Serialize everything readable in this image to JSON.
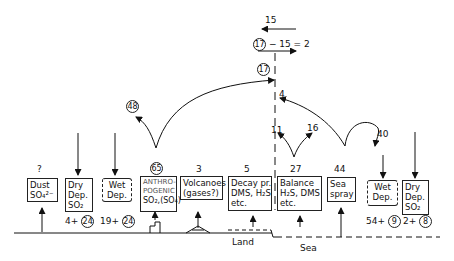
{
  "diagram": {
    "type": "sulfur-cycle-flux-diagram",
    "top": {
      "flux_left": "15",
      "flux_right_expr_circled": "17",
      "flux_right_expr_rest": "− 15 = 2",
      "transport_circled": "17"
    },
    "arcs": {
      "anthro_to_land_circled": "48",
      "sea_to_boundary": "4",
      "balance_left": "11",
      "balance_right": "16",
      "seaspray_to_wet": "40"
    },
    "sources": [
      {
        "id": "dust",
        "value": "?",
        "lines": [
          "Dust",
          "SO₄²⁻"
        ]
      },
      {
        "id": "dry-dep-land",
        "lines": [
          "Dry",
          "Dep.",
          "SO₂"
        ],
        "below_plain": "4+",
        "below_circled": "24"
      },
      {
        "id": "wet-dep-land",
        "lines": [
          "Wet",
          "Dep."
        ],
        "below_plain": "19+",
        "below_circled": "24"
      },
      {
        "id": "anthropogenic",
        "value_circled": "65",
        "lines": [
          "ANTHRO-",
          "POGENIC",
          "SO₂,(SO₄)"
        ]
      },
      {
        "id": "volcanoes",
        "value": "3",
        "lines": [
          "Volcanoes",
          "(gases?)"
        ]
      },
      {
        "id": "decay",
        "value": "5",
        "lines": [
          "Decay pr.",
          "DMS, H₂S",
          "etc."
        ]
      },
      {
        "id": "balance",
        "value": "27",
        "lines": [
          "Balance",
          "H₂S, DMS",
          "etc."
        ]
      },
      {
        "id": "sea-spray",
        "value": "44",
        "lines": [
          "Sea",
          "spray"
        ]
      },
      {
        "id": "wet-dep-sea",
        "lines": [
          "Wet",
          "Dep."
        ],
        "below_plain": "54+",
        "below_circled": "9"
      },
      {
        "id": "dry-dep-sea",
        "lines": [
          "Dry",
          "Dep.",
          "SO₂"
        ],
        "below_plain": "2+",
        "below_circled": "8"
      }
    ],
    "ground": {
      "land_label": "Land",
      "sea_label": "Sea"
    },
    "colors": {
      "ink": "#111111",
      "background": "#ffffff"
    }
  }
}
